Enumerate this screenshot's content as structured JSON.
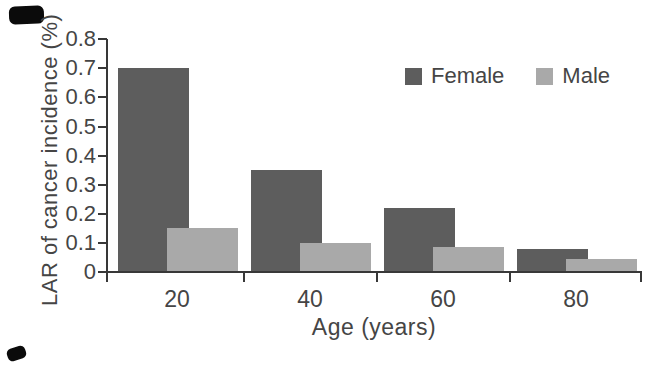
{
  "chart_data": {
    "type": "bar",
    "title": "",
    "categories": [
      "20",
      "40",
      "60",
      "80"
    ],
    "series": [
      {
        "name": "Female",
        "color": "#5d5d5d",
        "values": [
          0.7,
          0.35,
          0.22,
          0.08
        ]
      },
      {
        "name": "Male",
        "color": "#a9a9a9",
        "values": [
          0.15,
          0.1,
          0.085,
          0.045
        ]
      }
    ],
    "xlabel": "Age (years)",
    "ylabel": "LAR of cancer incidence (%)",
    "ylim": [
      0,
      0.8
    ],
    "ytick_step": 0.1,
    "ytick_labels": [
      "0",
      "0.1",
      "0.2",
      "0.3",
      "0.4",
      "0.5",
      "0.6",
      "0.7",
      "0.8"
    ],
    "legend": {
      "position": "top-right",
      "entries": [
        "Female",
        "Male"
      ]
    },
    "grid": false,
    "bar_style": "grouped-overlapping",
    "axis_color": "#383838",
    "text_color": "#454545",
    "background": "#ffffff"
  }
}
